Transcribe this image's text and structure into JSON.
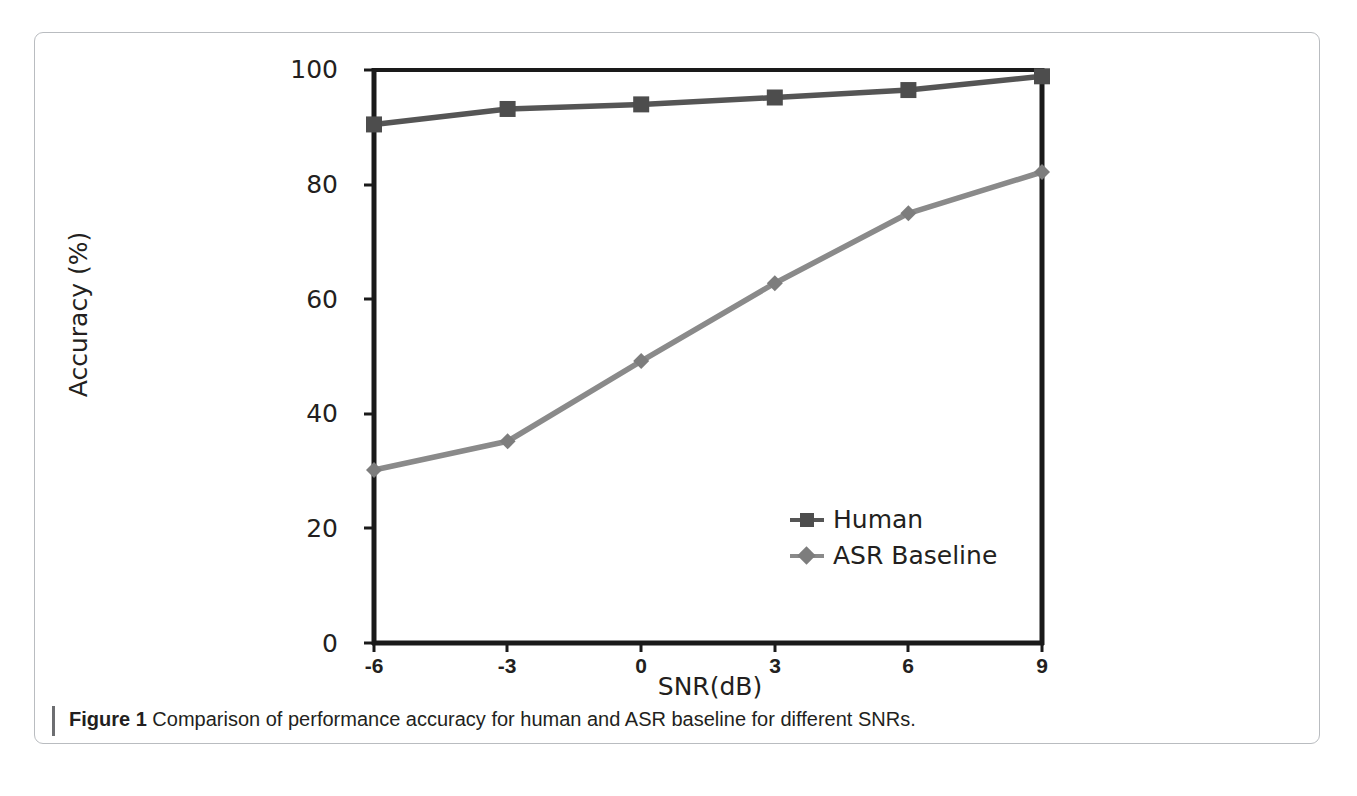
{
  "figure": {
    "caption_prefix": "Figure 1",
    "caption_body": "Comparison of performance accuracy for human and ASR baseline for different SNRs."
  },
  "colors": {
    "axis": "#1a1a1a",
    "human_line": "#555555",
    "asr_line": "#8a8a8a",
    "human_marker": "#4d4d4d",
    "asr_marker": "#7d7d7d",
    "frame": "#b9bcc0",
    "caption_rule": "#6d6e71",
    "text": "#231f20"
  },
  "chart_data": {
    "type": "line",
    "title": "",
    "xlabel": "SNR(dB)",
    "ylabel": "Accuracy (%)",
    "x": [
      -6,
      -3,
      0,
      3,
      6,
      9
    ],
    "xticklabels": [
      "-6",
      "-3",
      "0",
      "3",
      "6",
      "9"
    ],
    "xlim": [
      -6,
      9
    ],
    "yticks": [
      0,
      20,
      40,
      60,
      80,
      100
    ],
    "yticklabels": [
      "0",
      "20",
      "40",
      "60",
      "80",
      "100"
    ],
    "ylim": [
      0,
      100
    ],
    "grid": false,
    "legend_position": "inside lower-right",
    "series": [
      {
        "name": "Human",
        "marker": "square",
        "values": [
          90.5,
          93.2,
          94.0,
          95.2,
          96.5,
          98.9
        ]
      },
      {
        "name": "ASR Baseline",
        "marker": "diamond",
        "values": [
          30.2,
          35.2,
          49.2,
          62.8,
          75.0,
          82.2
        ]
      }
    ]
  }
}
